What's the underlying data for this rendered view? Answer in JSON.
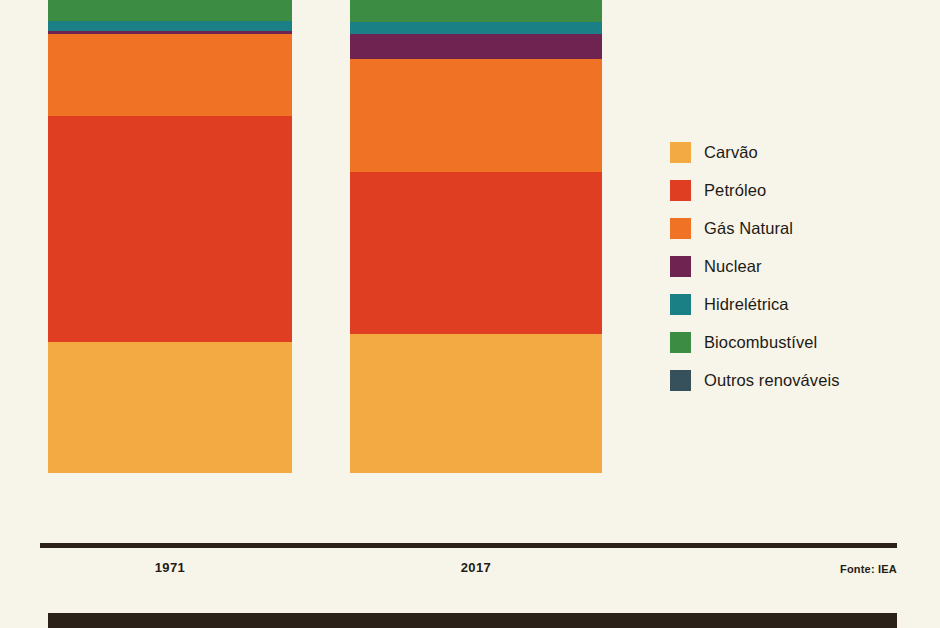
{
  "chart_data": {
    "type": "bar",
    "subtype": "stacked-percent",
    "title": "",
    "xlabel": "",
    "ylabel": "",
    "categories": [
      "1971",
      "2017"
    ],
    "grid": false,
    "legend_position": "right",
    "ylim": [
      0,
      100
    ],
    "source": "Fonte: IEA",
    "series": [
      {
        "name": "Carvão",
        "color": "#f4aa42",
        "values": [
          25.8,
          27.3
        ]
      },
      {
        "name": "Petróleo",
        "color": "#e03e22",
        "values": [
          44.4,
          31.8
        ]
      },
      {
        "name": "Gás Natural",
        "color": "#f07325",
        "values": [
          16.1,
          22.0
        ]
      },
      {
        "name": "Nuclear",
        "color": "#6e2350",
        "values": [
          0.6,
          4.9
        ]
      },
      {
        "name": "Hidrelétrica",
        "color": "#1b7f86",
        "values": [
          2.0,
          2.5
        ]
      },
      {
        "name": "Biocombustível",
        "color": "#3c8c43",
        "values": [
          11.1,
          10.1
        ]
      },
      {
        "name": "Outros renováveis",
        "color": "#36505c",
        "values": [
          0.0,
          1.4
        ]
      }
    ],
    "stack_order_top_to_bottom": [
      "Outros renováveis",
      "Biocombustível",
      "Hidrelétrica",
      "Nuclear",
      "Gás Natural",
      "Petróleo",
      "Carvão"
    ]
  },
  "legend": {
    "items": [
      {
        "label": "Carvão",
        "color": "#f4aa42"
      },
      {
        "label": "Petróleo",
        "color": "#e03e22"
      },
      {
        "label": "Gás Natural",
        "color": "#f07325"
      },
      {
        "label": "Nuclear",
        "color": "#6e2350"
      },
      {
        "label": "Hidrelétrica",
        "color": "#1b7f86"
      },
      {
        "label": "Biocombustível",
        "color": "#3c8c43"
      },
      {
        "label": "Outros renováveis",
        "color": "#36505c"
      }
    ]
  },
  "axis": {
    "tick_labels": [
      "1971",
      "2017"
    ]
  },
  "footer": {
    "source": "Fonte: IEA"
  },
  "colors": {
    "background": "#f7f4e9",
    "axis": "#2b2119",
    "text": "#1d1a16",
    "band": "#2b2119"
  }
}
